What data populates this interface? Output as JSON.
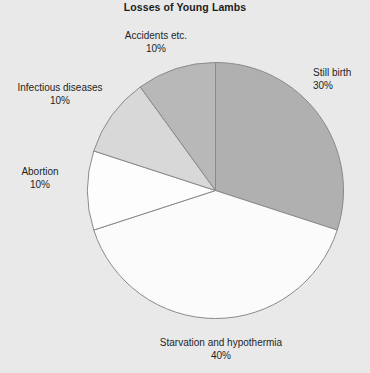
{
  "chart_data": {
    "type": "pie",
    "title": "Losses of Young Lambs",
    "xlabel": "",
    "ylabel": "",
    "legend": "none",
    "grid": false,
    "labels": [
      "Still birth",
      "Starvation and hypothermia",
      "Abortion",
      "Infectious diseases",
      "Accidents etc."
    ],
    "values": [
      30,
      40,
      10,
      10,
      10
    ],
    "value_labels": [
      "30%",
      "40%",
      "10%",
      "10%",
      "10%"
    ],
    "colors": [
      "#b0b0b0",
      "#fbfbfb",
      "#fdfdfd",
      "#d8d8d8",
      "#b8b8b8"
    ],
    "start_angle_deg": 0,
    "direction": "clockwise",
    "units": "percent",
    "total": 100
  },
  "header": {
    "title": "Losses of Young Lambs"
  },
  "slices": [
    {
      "name": "Still birth",
      "percent_label": "30%",
      "value": 30,
      "color": "#b0b0b0"
    },
    {
      "name": "Starvation and hypothermia",
      "percent_label": "40%",
      "value": 40,
      "color": "#fbfbfb"
    },
    {
      "name": "Abortion",
      "percent_label": "10%",
      "value": 10,
      "color": "#fdfdfd"
    },
    {
      "name": "Infectious diseases",
      "percent_label": "10%",
      "value": 10,
      "color": "#d8d8d8"
    },
    {
      "name": "Accidents etc.",
      "percent_label": "10%",
      "value": 10,
      "color": "#b8b8b8"
    }
  ],
  "style": {
    "background": "#e9e9e9",
    "outline": "#8a8a8a",
    "text": "#1f1f1f"
  }
}
